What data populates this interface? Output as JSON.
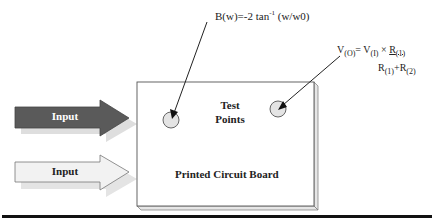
{
  "diagram": {
    "board": {
      "label": "Printed Circuit Board",
      "test_points_label_line1": "Test",
      "test_points_label_line2": "Points"
    },
    "inputs": [
      {
        "label": "Input",
        "style": "dark",
        "fill": "#5a5a5a"
      },
      {
        "label": "Input",
        "style": "light",
        "fill": "#f2f2f2"
      }
    ],
    "formulas": {
      "phase": {
        "prefix": "B(w)=-2 tan",
        "sup": "-1",
        "suffix": " (w/w0)"
      },
      "voltage": {
        "v": "V",
        "vo_sub": "(O)",
        "eq": "= V",
        "vi_sub": "(I)",
        "times": " × ",
        "num_r": "R",
        "num_sub": "(1)",
        "den_r1": "R",
        "den_sub1": "(1)",
        "plus": "+R",
        "den_sub2": "(2)"
      }
    },
    "colors": {
      "dark_arrow": "#5a5a5a",
      "light_arrow": "#f2f2f2",
      "shadow": "#dddddd",
      "test_point": "#e4e4e4",
      "rule": "#111111"
    }
  }
}
